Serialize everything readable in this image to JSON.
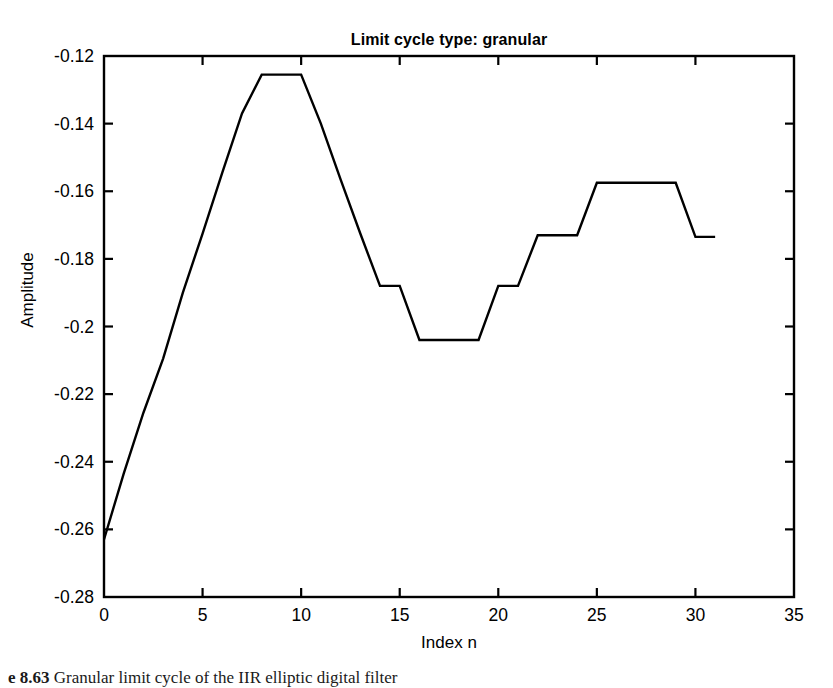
{
  "chart_data": {
    "type": "line",
    "title": "Limit cycle type: granular",
    "xlabel": "Index n",
    "ylabel": "Amplitude",
    "xlim": [
      0,
      35
    ],
    "ylim": [
      -0.28,
      -0.12
    ],
    "xticks": [
      "0",
      "5",
      "10",
      "15",
      "20",
      "25",
      "30",
      "35"
    ],
    "xtick_values": [
      0,
      5,
      10,
      15,
      20,
      25,
      30,
      35
    ],
    "yticks": [
      "-0.12",
      "-0.14",
      "-0.16",
      "-0.18",
      "-0.2",
      "-0.22",
      "-0.24",
      "-0.26",
      "-0.28"
    ],
    "ytick_values": [
      -0.12,
      -0.14,
      -0.16,
      -0.18,
      -0.2,
      -0.22,
      -0.24,
      -0.26,
      -0.28
    ],
    "grid": false,
    "legend": null,
    "line_color": "#000000",
    "line_width": 2,
    "series": [
      {
        "name": "granular limit cycle",
        "x": [
          0,
          1,
          2,
          3,
          4,
          5,
          6,
          7,
          8,
          9,
          10,
          11,
          12,
          13,
          14,
          15,
          16,
          17,
          18,
          19,
          20,
          21,
          22,
          23,
          24,
          25,
          26,
          27,
          28,
          29,
          30,
          31
        ],
        "values": [
          -0.263,
          -0.2435,
          -0.2255,
          -0.2095,
          -0.19,
          -0.1725,
          -0.1545,
          -0.137,
          -0.1255,
          -0.1255,
          -0.1255,
          -0.14,
          -0.1565,
          -0.1725,
          -0.188,
          -0.188,
          -0.204,
          -0.204,
          -0.204,
          -0.204,
          -0.188,
          -0.188,
          -0.173,
          -0.173,
          -0.173,
          -0.1575,
          -0.1575,
          -0.1575,
          -0.1575,
          -0.1575,
          -0.1735,
          -0.1735
        ]
      }
    ]
  },
  "caption": {
    "number": "e 8.63",
    "text": "Granular limit cycle of the IIR elliptic digital filter"
  }
}
